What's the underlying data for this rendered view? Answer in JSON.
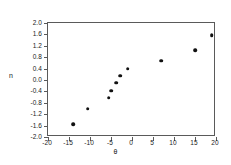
{
  "chart_data": {
    "type": "scatter",
    "title": "",
    "xlabel": "θ",
    "ylabel": "n",
    "xlim": [
      -20,
      20
    ],
    "ylim": [
      -2.0,
      2.0
    ],
    "grid": false,
    "legend": null,
    "xticks": [
      -20,
      -15,
      -10,
      -5,
      0,
      5,
      10,
      15,
      20
    ],
    "xtick_labels": [
      "-20",
      "-15",
      "-10",
      "-5",
      "0",
      "5",
      "10",
      "15",
      "20"
    ],
    "yticks": [
      2.0,
      1.6,
      1.2,
      0.8,
      0.4,
      0.0,
      -0.4,
      -0.8,
      -1.2,
      -1.6,
      -2.0
    ],
    "ytick_labels": [
      "2.0",
      "1.6",
      "1.2",
      "0.8",
      "0.4",
      "0.0",
      "-0.4",
      "-0.8",
      "-1.2",
      "-1.6",
      "-2.0"
    ],
    "series": [
      {
        "name": "n vs theta",
        "marker": "circle",
        "color": "#111111",
        "x": [
          -14.0,
          -10.5,
          -5.5,
          -5.0,
          -3.8,
          -2.8,
          -1.0,
          7.0,
          15.0,
          19.0
        ],
        "y": [
          -1.55,
          -1.0,
          -0.62,
          -0.38,
          -0.1,
          0.15,
          0.4,
          0.68,
          1.05,
          1.58
        ]
      }
    ]
  },
  "figure": {
    "background_color": "#ffffff",
    "frame_color": "#5a5a5a",
    "marker_color": "#111111"
  }
}
